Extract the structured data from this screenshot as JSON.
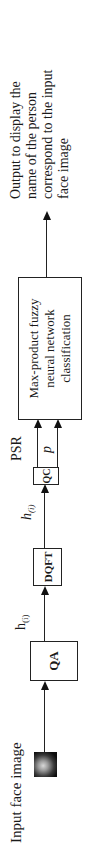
{
  "diagram": {
    "input_label": "Input face image",
    "blocks": {
      "qa": "QA",
      "dqft": "DQFT",
      "qc": "QC",
      "classifier_lines": [
        "Max-product fuzzy",
        "neural network",
        "classification"
      ]
    },
    "edge_labels": {
      "qa_to_dqft": "h",
      "qa_to_dqft_sub": "(i)",
      "dqft_to_qc": "h",
      "dqft_to_qc_sub": "(i)",
      "qc_psr": "PSR",
      "qc_p": "p"
    },
    "output_lines": [
      "Output to display the",
      "name of the person",
      "correspond to the input",
      "face image"
    ],
    "colors": {
      "line": "#222222",
      "background": "#ffffff"
    }
  }
}
